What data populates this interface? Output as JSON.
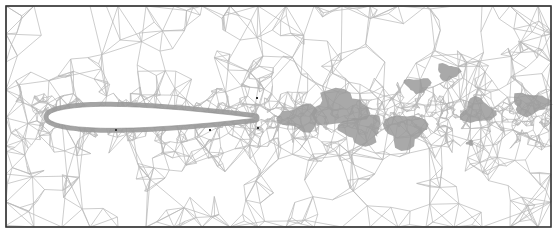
{
  "figure": {
    "type": "unstructured-triangular-mesh",
    "frame": {
      "x": 6,
      "y": 6,
      "width": 545,
      "height": 221,
      "stroke": "#333333"
    },
    "colors": {
      "background": "#ffffff",
      "mesh_line": "#b8b8b8",
      "dense_region": "#9a9a9a",
      "airfoil_fill": "#ffffff",
      "frame": "#333333",
      "marker": "#333333"
    },
    "airfoil": {
      "leading_edge": [
        48,
        117
      ],
      "trailing_edge": [
        255,
        118
      ],
      "max_thickness": 22
    },
    "wake_blobs": [
      {
        "cx": 300,
        "cy": 118,
        "rx": 22,
        "ry": 14
      },
      {
        "cx": 340,
        "cy": 108,
        "rx": 30,
        "ry": 20
      },
      {
        "cx": 362,
        "cy": 130,
        "rx": 22,
        "ry": 16
      },
      {
        "cx": 405,
        "cy": 130,
        "rx": 22,
        "ry": 18
      },
      {
        "cx": 418,
        "cy": 85,
        "rx": 14,
        "ry": 8
      },
      {
        "cx": 448,
        "cy": 72,
        "rx": 12,
        "ry": 9
      },
      {
        "cx": 478,
        "cy": 111,
        "rx": 18,
        "ry": 13
      },
      {
        "cx": 530,
        "cy": 104,
        "rx": 20,
        "ry": 12
      },
      {
        "cx": 470,
        "cy": 143,
        "rx": 4,
        "ry": 3
      }
    ],
    "markers": [
      [
        116,
        130
      ],
      [
        210,
        130
      ],
      [
        258,
        128
      ],
      [
        257,
        98
      ]
    ]
  }
}
